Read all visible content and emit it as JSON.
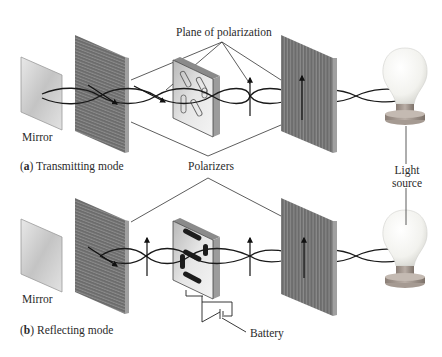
{
  "labels": {
    "plane_of_polarization": "Plane of polarization",
    "polarizers": "Polarizers",
    "mirror_top": "Mirror",
    "mirror_bottom": "Mirror",
    "light_source_line1": "Light",
    "light_source_line2": "source",
    "battery": "Battery"
  },
  "captions": {
    "a_letter": "a",
    "a_text": "Transmitting mode",
    "b_letter": "b",
    "b_text": "Reflecting mode"
  },
  "panels": [
    {
      "id": "a",
      "mode": "Transmitting mode",
      "lcd_segments": "transparent (outlined)",
      "battery": false
    },
    {
      "id": "b",
      "mode": "Reflecting mode",
      "lcd_segments": "dark (activated)",
      "battery": true
    }
  ],
  "colors": {
    "polarizer": "#6f6f6f",
    "polarizer_edge": "#9a9a9a",
    "wave": "#1a1a1a",
    "mirror": "#cfcfcf",
    "lcd_face": "#d8d8d8",
    "lcd_segment_on": "#1c1c1c",
    "bulb": "#f4f4f0",
    "bulb_base": "#9a8f86"
  }
}
